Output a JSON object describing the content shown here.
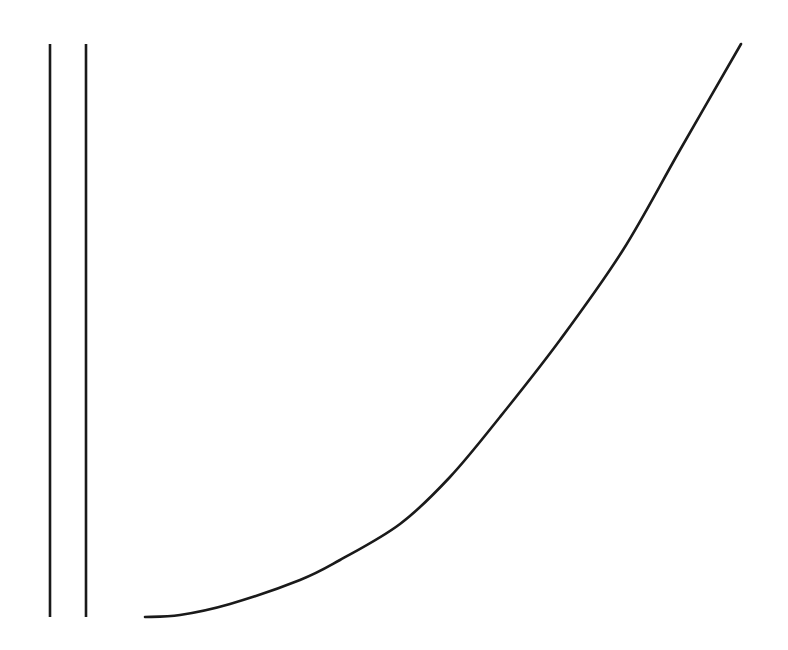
{
  "diagram": {
    "background": "#ffffff",
    "stroke_color": "#1a1a1a",
    "stroke_width": 2.6,
    "vertical_lines": [
      {
        "x": 50,
        "y1": 44,
        "y2": 617
      },
      {
        "x": 86,
        "y1": 44,
        "y2": 617
      }
    ],
    "curve": {
      "points": [
        [
          145,
          617
        ],
        [
          180,
          615
        ],
        [
          230,
          604
        ],
        [
          300,
          580
        ],
        [
          340,
          560
        ],
        [
          400,
          524
        ],
        [
          450,
          477
        ],
        [
          500,
          417
        ],
        [
          560,
          340
        ],
        [
          623,
          250
        ],
        [
          680,
          150
        ],
        [
          741,
          44
        ]
      ]
    }
  }
}
